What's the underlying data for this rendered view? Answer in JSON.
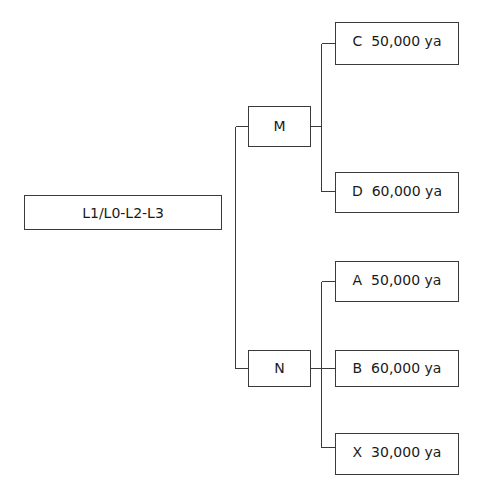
{
  "diagram": {
    "root": {
      "label": "L1/L0-L2-L3"
    },
    "branches": [
      {
        "label": "M",
        "children": [
          {
            "label": "C  50,000 ya"
          },
          {
            "label": "D  60,000 ya"
          }
        ]
      },
      {
        "label": "N",
        "children": [
          {
            "label": "A  50,000 ya"
          },
          {
            "label": "B  60,000 ya"
          },
          {
            "label": "X  30,000 ya"
          }
        ]
      }
    ],
    "line_color": "#3a3a3a"
  }
}
